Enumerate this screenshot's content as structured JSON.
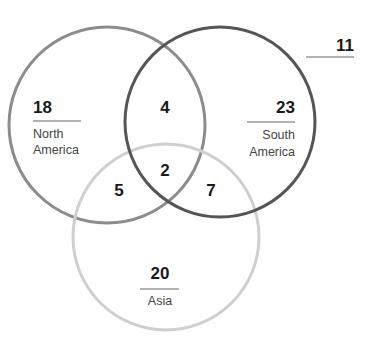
{
  "diagram": {
    "type": "venn",
    "sets": [
      {
        "id": "north_america",
        "label_line1": "North",
        "label_line2": "America",
        "only_count": "18",
        "stroke": "#8c8c8c",
        "cx": 107,
        "cy": 125,
        "r": 98
      },
      {
        "id": "south_america",
        "label_line1": "South",
        "label_line2": "America",
        "only_count": "23",
        "stroke": "#505050",
        "cx": 220,
        "cy": 122,
        "r": 95
      },
      {
        "id": "asia",
        "label": "Asia",
        "only_count": "20",
        "stroke": "#c8c8c8",
        "cx": 166,
        "cy": 237,
        "r": 93
      }
    ],
    "intersections": {
      "north_south": "4",
      "north_asia": "5",
      "south_asia": "7",
      "all_three": "2"
    },
    "outside_count": "11"
  }
}
